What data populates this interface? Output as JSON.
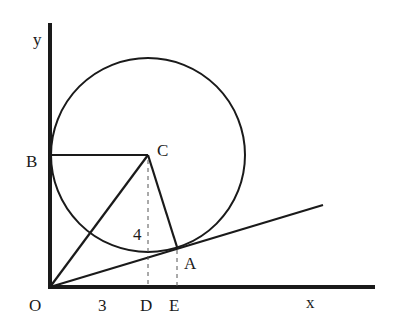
{
  "diagram": {
    "type": "geometry",
    "stroke_color": "#1a1a1a",
    "labels": {
      "y_axis": "y",
      "x_axis": "x",
      "origin": "O",
      "B": "B",
      "C": "C",
      "A": "A",
      "D": "D",
      "E": "E",
      "len_od": "3",
      "len_cd": "4"
    },
    "points": {
      "O": [
        50,
        287
      ],
      "B": [
        50,
        155
      ],
      "C": [
        148,
        155
      ],
      "A": [
        177,
        247
      ],
      "D": [
        148,
        287
      ],
      "E": [
        177,
        287
      ],
      "tangent_end": [
        323,
        205
      ]
    },
    "circle": {
      "cx": 148,
      "cy": 155,
      "r": 97
    }
  }
}
